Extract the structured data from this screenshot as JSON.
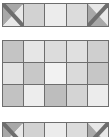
{
  "figure": {
    "type": "grid-diagram",
    "background_color": "#ffffff",
    "grid_line_color": "#6e6e6e",
    "columns": 5,
    "blocks": [
      {
        "name": "top-strip",
        "rows": 1,
        "cells": [
          {
            "fill": "#ffffff",
            "split": "tl-br",
            "upper_fill": "#a8a8a8",
            "lower_fill": "#e8e8e8"
          },
          {
            "fill": "#d2d2d2",
            "split": "none"
          },
          {
            "fill": "#ececec",
            "split": "none"
          },
          {
            "fill": "#dcdcdc",
            "split": "none"
          },
          {
            "fill": "#ffffff",
            "split": "tr-bl",
            "upper_fill": "#e8e8e8",
            "lower_fill": "#a8a8a8"
          }
        ]
      },
      {
        "name": "middle-grid",
        "rows": 3,
        "cells": [
          {
            "fill": "#c4c4c4",
            "split": "none"
          },
          {
            "fill": "#e6e6e6",
            "split": "none"
          },
          {
            "fill": "#dcdcdc",
            "split": "none"
          },
          {
            "fill": "#e0e0e0",
            "split": "none"
          },
          {
            "fill": "#cfcfcf",
            "split": "none"
          },
          {
            "fill": "#e2e2e2",
            "split": "none"
          },
          {
            "fill": "#c8c8c8",
            "split": "none"
          },
          {
            "fill": "#f2f2f2",
            "split": "none"
          },
          {
            "fill": "#dadada",
            "split": "none"
          },
          {
            "fill": "#c6c6c6",
            "split": "none"
          },
          {
            "fill": "#c2c2c2",
            "split": "none"
          },
          {
            "fill": "#ededed",
            "split": "none"
          },
          {
            "fill": "#bdbdbd",
            "split": "none"
          },
          {
            "fill": "#d4d4d4",
            "split": "none"
          },
          {
            "fill": "#ececec",
            "split": "none"
          }
        ]
      },
      {
        "name": "bottom-strip",
        "rows": 1,
        "cells": [
          {
            "fill": "#ffffff",
            "split": "tl-br",
            "upper_fill": "#a8a8a8",
            "lower_fill": "#e8e8e8"
          },
          {
            "fill": "#d2d2d2",
            "split": "none"
          },
          {
            "fill": "#ececec",
            "split": "none"
          },
          {
            "fill": "#dcdcdc",
            "split": "none"
          },
          {
            "fill": "#ffffff",
            "split": "tr-bl",
            "upper_fill": "#e8e8e8",
            "lower_fill": "#a8a8a8"
          }
        ]
      }
    ]
  }
}
